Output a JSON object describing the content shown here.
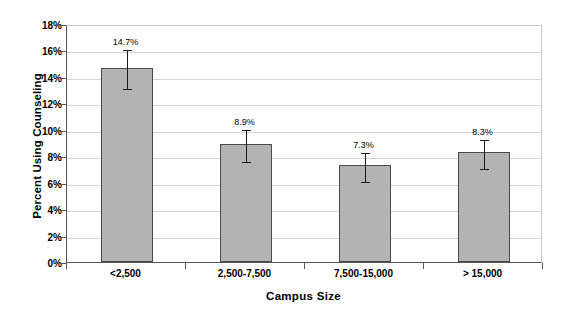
{
  "chart_data": {
    "type": "bar",
    "title": "",
    "subtitle": "",
    "xlabel": "Campus Size",
    "ylabel": "Percent Using Counseling",
    "categories": [
      "<2,500",
      "2,500-7,500",
      "7,500-15,000",
      "> 15,000"
    ],
    "values": [
      14.7,
      8.9,
      7.3,
      8.3
    ],
    "data_labels": [
      "14.7%",
      "8.9%",
      "7.3%",
      "8.3%"
    ],
    "error_bars": {
      "shown": true,
      "upper": [
        1.5,
        1.2,
        1.1,
        1.1
      ],
      "lower": [
        1.5,
        1.2,
        1.1,
        1.1
      ]
    },
    "ylim": [
      0,
      18
    ],
    "ytick_values": [
      0,
      2,
      4,
      6,
      8,
      10,
      12,
      14,
      16,
      18
    ],
    "ytick_labels": [
      "0%",
      "2%",
      "4%",
      "6%",
      "8%",
      "10%",
      "12%",
      "14%",
      "16%",
      "18%"
    ],
    "grid": {
      "horizontal": true,
      "vertical": false
    },
    "legend": {
      "shown": false,
      "position": "none"
    },
    "colors": {
      "bar_fill": "#b3b3b3",
      "bar_border": "#4a4a4a",
      "gridline": "#d5d5d5",
      "axis": "#555555",
      "error_bar": "#1a1a1a",
      "background": "#ffffff",
      "text": "#000000"
    }
  }
}
